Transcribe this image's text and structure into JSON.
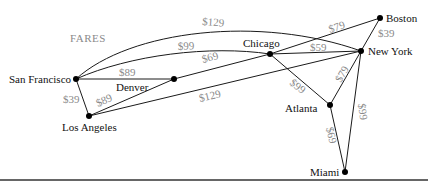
{
  "title": "FARES",
  "colors": {
    "edge": "#1a1a1a",
    "node": "#000000",
    "city_text": "#111111",
    "fare_text": "#8a8a8a",
    "rule": "#333333"
  },
  "cities": [
    {
      "id": "sf",
      "label": "San Francisco",
      "x": 76,
      "y": 79
    },
    {
      "id": "denver",
      "label": "Denver",
      "x": 174,
      "y": 79
    },
    {
      "id": "la",
      "label": "Los Angeles",
      "x": 89,
      "y": 116
    },
    {
      "id": "chicago",
      "label": "Chicago",
      "x": 270,
      "y": 54
    },
    {
      "id": "newyork",
      "label": "New York",
      "x": 361,
      "y": 51
    },
    {
      "id": "boston",
      "label": "Boston",
      "x": 380,
      "y": 18
    },
    {
      "id": "atlanta",
      "label": "Atlanta",
      "x": 330,
      "y": 105
    },
    {
      "id": "miami",
      "label": "Miami",
      "x": 345,
      "y": 172
    }
  ],
  "routes": [
    {
      "from": "San Francisco",
      "to": "New York",
      "fare": "$129"
    },
    {
      "from": "San Francisco",
      "to": "Chicago",
      "fare": "$99"
    },
    {
      "from": "San Francisco",
      "to": "Denver",
      "fare": "$89"
    },
    {
      "from": "San Francisco",
      "to": "Los Angeles",
      "fare": "$39"
    },
    {
      "from": "Denver",
      "to": "Chicago",
      "fare": "$69"
    },
    {
      "from": "Denver",
      "to": "Los Angeles",
      "fare": "$89"
    },
    {
      "from": "Los Angeles",
      "to": "New York",
      "fare": "$129"
    },
    {
      "from": "Chicago",
      "to": "Boston",
      "fare": "$79"
    },
    {
      "from": "Chicago",
      "to": "New York",
      "fare": "$59"
    },
    {
      "from": "Chicago",
      "to": "Atlanta",
      "fare": "$99"
    },
    {
      "from": "New York",
      "to": "Boston",
      "fare": "$39"
    },
    {
      "from": "New York",
      "to": "Atlanta",
      "fare": "$79"
    },
    {
      "from": "New York",
      "to": "Miami",
      "fare": "$99"
    },
    {
      "from": "Atlanta",
      "to": "Miami",
      "fare": "$69"
    }
  ]
}
